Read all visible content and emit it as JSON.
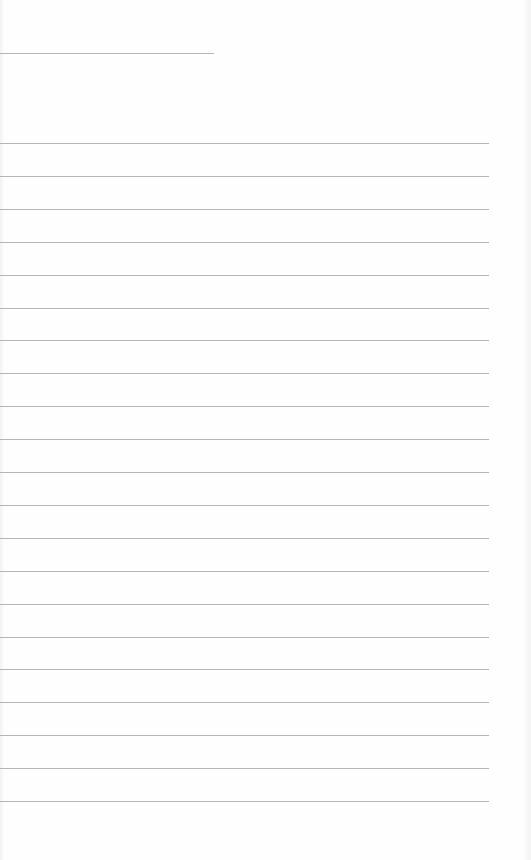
{
  "document": {
    "type": "blank ruled paper",
    "header_rule": {
      "y": 53,
      "length": 214
    },
    "ruled_lines": {
      "count": 21,
      "first_y": 143,
      "spacing": 32.9,
      "length": 489
    },
    "colors": {
      "paper": "#fefefe",
      "rule": "#a9a9a9"
    }
  }
}
